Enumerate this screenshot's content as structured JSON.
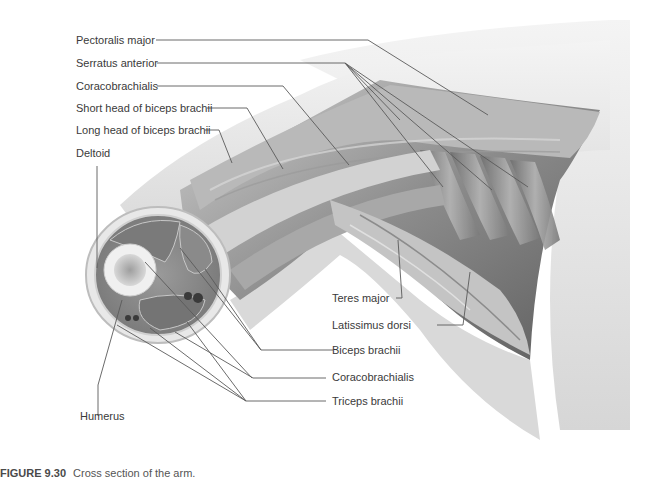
{
  "figure": {
    "number": "FIGURE 9.30",
    "caption": "Cross section of the arm."
  },
  "labels": {
    "pectoralis_major": "Pectoralis major",
    "serratus_anterior": "Serratus anterior",
    "coracobrachialis_top": "Coracobrachialis",
    "short_head_biceps": "Short head of biceps brachii",
    "long_head_biceps": "Long head of biceps brachii",
    "deltoid": "Deltoid",
    "humerus": "Humerus",
    "teres_major": "Teres major",
    "latissimus_dorsi": "Latissimus dorsi",
    "biceps_brachii": "Biceps brachii",
    "coracobrachialis_bottom": "Coracobrachialis",
    "triceps_brachii": "Triceps brachii"
  },
  "colors": {
    "leader_line": "#5a5a5a",
    "label_text": "#3a3a3a",
    "skin": "#e6e6e6",
    "muscle": "#8a8a8a",
    "bone": "#f2f2f2"
  }
}
